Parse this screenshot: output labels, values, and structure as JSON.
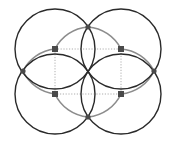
{
  "diagram": {
    "width": 175,
    "height": 141,
    "colors": {
      "background": "#ffffff",
      "circle_stroke": "#2a2a2a",
      "arc_stroke": "#8c8c8c",
      "dotted_stroke": "#9a9a9a",
      "node_fill": "#4a4a4a"
    },
    "circles": [
      {
        "id": "top-left",
        "cx": 55,
        "cy": 49,
        "r": 40
      },
      {
        "id": "top-right",
        "cx": 121,
        "cy": 49,
        "r": 40
      },
      {
        "id": "bottom-left",
        "cx": 55,
        "cy": 94,
        "r": 40
      },
      {
        "id": "bottom-right",
        "cx": 121,
        "cy": 94,
        "r": 40
      }
    ],
    "square_nodes": [
      {
        "id": "sq-top-left",
        "x": 55,
        "y": 49
      },
      {
        "id": "sq-top-right",
        "x": 121,
        "y": 49
      },
      {
        "id": "sq-bottom-left",
        "x": 55,
        "y": 94
      },
      {
        "id": "sq-bottom-right",
        "x": 121,
        "y": 94
      }
    ],
    "intersection_nodes": [
      {
        "id": "node-top",
        "x": 88,
        "y": 27
      },
      {
        "id": "node-left",
        "x": 23,
        "y": 71
      },
      {
        "id": "node-right",
        "x": 154,
        "y": 71
      },
      {
        "id": "node-bottom",
        "x": 88,
        "y": 117
      }
    ],
    "gray_arcs": [
      {
        "id": "arc-top",
        "d": "M55,49 A36,36 0 0 1 121,49"
      },
      {
        "id": "arc-bottom",
        "d": "M55,94 A36,36 0 0 0 121,94"
      },
      {
        "id": "arc-left",
        "d": "M55,49 A24,24 0 0 0 55,94"
      },
      {
        "id": "arc-right",
        "d": "M121,49 A24,24 0 0 1 121,94"
      },
      {
        "id": "arc-left-upper",
        "d": "M55,49 A40,40 0 0 0 23,71"
      },
      {
        "id": "arc-left-lower",
        "d": "M23,71 A40,40 0 0 0 55,94"
      },
      {
        "id": "arc-right-upper",
        "d": "M121,49 A40,40 0 0 1 154,71"
      },
      {
        "id": "arc-right-lower",
        "d": "M154,71 A40,40 0 0 1 121,94"
      },
      {
        "id": "arc-top-left",
        "d": "M55,49 A40,40 0 0 1 88,27"
      },
      {
        "id": "arc-top-right",
        "d": "M88,27 A40,40 0 0 1 121,49"
      },
      {
        "id": "arc-bottom-left",
        "d": "M55,94 A40,40 0 0 0 88,117"
      },
      {
        "id": "arc-bottom-right",
        "d": "M88,117 A40,40 0 0 0 121,94"
      }
    ],
    "dotted_rect": {
      "x": 55,
      "y": 49,
      "width": 66,
      "height": 45
    }
  }
}
